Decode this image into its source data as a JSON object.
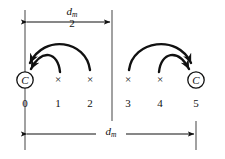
{
  "figure": {
    "background_color": "#ffffff",
    "ink_color": "#111111",
    "rule_color": "#8a8a8a"
  },
  "dimensions": {
    "top": {
      "numerator": "d",
      "numerator_sub": "m",
      "denominator": "2",
      "plain": "d_m/2",
      "arrow_style": "double",
      "x_start": 25,
      "x_end": 112,
      "y": 22
    },
    "bottom": {
      "symbol": "d",
      "symbol_sub": "m",
      "plain": "d_m",
      "arrow_style": "double",
      "x_start": 25,
      "x_end": 196,
      "y": 134
    }
  },
  "extension_lines": [
    {
      "name": "left",
      "x": 25,
      "y_top": 10,
      "y_bottom": 150
    },
    {
      "name": "middle",
      "x": 112,
      "y_top": 10,
      "y_bottom": 121
    },
    {
      "name": "right",
      "x": 196,
      "y_top": 121,
      "y_bottom": 150
    }
  ],
  "groups": [
    {
      "name": "left-group",
      "nodes": [
        {
          "index": "0",
          "glyph": "C",
          "kind": "circled-c",
          "x": 25,
          "y": 80
        },
        {
          "index": "1",
          "glyph": "×",
          "kind": "cross",
          "x": 58,
          "y": 80
        },
        {
          "index": "2",
          "glyph": "×",
          "kind": "cross",
          "x": 90,
          "y": 80
        }
      ],
      "arrows": [
        {
          "name": "arrow-1-to-0",
          "from": "1",
          "to": "0",
          "apex_y": 56
        },
        {
          "name": "arrow-2-to-0",
          "from": "2",
          "to": "0",
          "apex_y": 41
        }
      ]
    },
    {
      "name": "right-group",
      "nodes": [
        {
          "index": "3",
          "glyph": "×",
          "kind": "cross",
          "x": 128,
          "y": 80
        },
        {
          "index": "4",
          "glyph": "×",
          "kind": "cross",
          "x": 160,
          "y": 80
        },
        {
          "index": "5",
          "glyph": "C",
          "kind": "circled-c",
          "x": 196,
          "y": 80
        }
      ],
      "arrows": [
        {
          "name": "arrow-4-to-5",
          "from": "4",
          "to": "5",
          "apex_y": 56
        },
        {
          "name": "arrow-3-to-5",
          "from": "3",
          "to": "5",
          "apex_y": 41
        }
      ]
    }
  ],
  "position_labels": [
    {
      "text": "0",
      "x": 25,
      "y": 98
    },
    {
      "text": "1",
      "x": 58,
      "y": 98
    },
    {
      "text": "2",
      "x": 90,
      "y": 98
    },
    {
      "text": "3",
      "x": 128,
      "y": 98
    },
    {
      "text": "4",
      "x": 160,
      "y": 98
    },
    {
      "text": "5",
      "x": 196,
      "y": 98
    }
  ]
}
